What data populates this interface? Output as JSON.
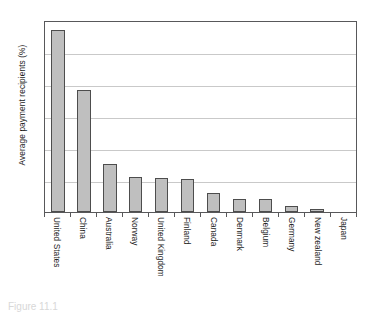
{
  "chart_data": {
    "type": "bar",
    "title": "",
    "xlabel": "",
    "ylabel": "Average payment recipients (%)",
    "ylim": [
      0,
      60
    ],
    "ytick_labels": [
      "60",
      "50",
      "40",
      "30",
      "20",
      "10",
      "0"
    ],
    "ytick_values": [
      60,
      50,
      40,
      30,
      20,
      10,
      0
    ],
    "grid": true,
    "legend": "none",
    "bar_color": "#bfbfbf",
    "bar_border_color": "#4d4d4d",
    "categories": [
      "United States",
      "China",
      "Australia",
      "Norway",
      "United Kingdom",
      "Finland",
      "Canada",
      "Denmark",
      "Belgium",
      "Germany",
      "New zealand",
      "Japan"
    ],
    "values": [
      57,
      38,
      15,
      11,
      10.5,
      10.2,
      6,
      4,
      4,
      2,
      0.8,
      0
    ]
  },
  "caption": {
    "text": "Figure 11.1"
  }
}
